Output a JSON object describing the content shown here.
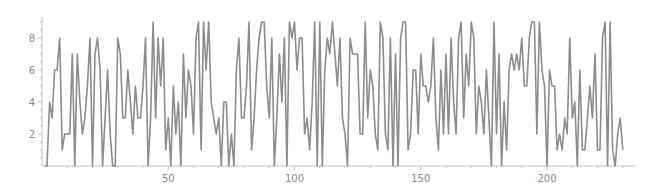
{
  "chart_data": {
    "type": "line",
    "title": "",
    "xlabel": "",
    "ylabel": "",
    "xlim": [
      0,
      235
    ],
    "ylim": [
      0,
      9.3
    ],
    "x_ticks": [
      50,
      100,
      150,
      200
    ],
    "y_ticks": [
      2,
      4,
      6,
      8
    ],
    "grid": false,
    "legend": null,
    "line_color": "#8c8c8c",
    "axis_color": "#c4c4c4",
    "x_start": 1,
    "values": [
      0,
      0,
      4,
      3,
      6,
      6,
      8,
      1,
      2,
      2,
      2,
      7,
      0,
      7,
      4,
      2,
      3,
      5,
      8,
      0,
      7,
      8,
      6,
      0,
      3,
      6,
      2,
      0,
      0,
      8,
      7,
      3,
      3,
      6,
      4,
      2,
      5,
      3,
      3,
      5,
      8,
      0,
      3,
      9,
      3,
      8,
      5,
      8,
      1,
      3,
      0,
      5,
      2,
      4,
      0,
      7,
      3,
      6,
      5,
      2,
      8,
      9,
      1,
      9,
      6,
      9,
      4,
      3,
      2,
      3,
      0,
      4,
      4,
      0,
      2,
      0,
      6,
      8,
      3,
      3,
      5,
      9,
      1,
      3,
      6,
      8,
      9,
      9,
      5,
      3,
      8,
      0,
      3,
      7,
      4,
      8,
      0,
      9,
      8,
      9,
      6,
      8,
      8,
      2,
      3,
      1,
      4,
      9,
      0,
      9,
      0,
      6,
      8,
      7,
      9,
      7,
      5,
      8,
      3,
      2,
      0,
      8,
      7,
      7,
      7,
      2,
      2,
      9,
      3,
      6,
      5,
      2,
      1,
      9,
      8,
      2,
      1,
      8,
      0,
      7,
      0,
      8,
      9,
      9,
      1,
      2,
      6,
      6,
      2,
      7,
      5,
      5,
      4,
      5,
      8,
      3,
      1,
      6,
      2,
      7,
      2,
      8,
      4,
      2,
      8,
      9,
      3,
      7,
      5,
      9,
      8,
      2,
      5,
      4,
      2,
      6,
      3,
      0,
      9,
      2,
      7,
      0,
      4,
      1,
      6,
      7,
      6,
      7,
      6,
      8,
      5,
      5,
      8,
      9,
      9,
      2,
      9,
      6,
      5,
      0,
      6,
      5,
      5,
      1,
      2,
      1,
      3,
      2,
      8,
      3,
      4,
      0,
      6,
      1,
      1,
      3,
      5,
      3,
      7,
      1,
      1,
      8,
      9,
      0,
      9,
      1,
      0,
      2,
      3,
      1
    ]
  }
}
